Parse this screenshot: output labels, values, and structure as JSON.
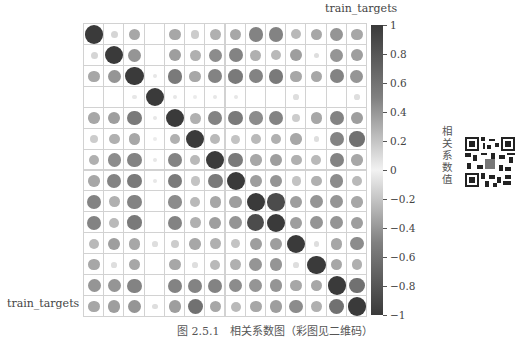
{
  "chart_data": {
    "type": "heatmap",
    "style": "correlation-circle-plot",
    "title": "",
    "xlabel": "train_targets",
    "ylabel": "train_targets",
    "n": 14,
    "colorbar": {
      "label": "相关系数值",
      "ticks": [
        "1",
        "0.8",
        "0.6",
        "0.4",
        "0.2",
        "0",
        "−0.2",
        "−0.4",
        "−0.6",
        "−0.8",
        "−1"
      ],
      "range": [
        -1,
        1
      ]
    },
    "matrix": [
      [
        1,
        0.15,
        0.4,
        0,
        0.4,
        0.2,
        0.35,
        0.4,
        0.6,
        0.6,
        0.3,
        0.4,
        0.5,
        0.4
      ],
      [
        0.15,
        1,
        0.5,
        0,
        0.45,
        0.35,
        0.55,
        0.6,
        0.35,
        0.3,
        0.45,
        0.1,
        0.5,
        0.45
      ],
      [
        0.4,
        0.5,
        1,
        0.05,
        0.65,
        0.4,
        0.6,
        0.65,
        0.6,
        0.65,
        0.4,
        0.4,
        0.6,
        0.5
      ],
      [
        0,
        0,
        0.05,
        1,
        0.05,
        0.03,
        0.05,
        0.05,
        0,
        0,
        0.1,
        0,
        0,
        0.1
      ],
      [
        0.4,
        0.45,
        0.65,
        0.05,
        1,
        0.35,
        0.6,
        0.65,
        0.55,
        0.6,
        0.2,
        0.4,
        0.6,
        0.45
      ],
      [
        0.2,
        0.35,
        0.4,
        0.03,
        0.35,
        1,
        0.3,
        0.25,
        0.3,
        0.35,
        0.4,
        0.1,
        0.6,
        0.7
      ],
      [
        0.35,
        0.55,
        0.6,
        0.05,
        0.6,
        0.3,
        1,
        0.65,
        0.4,
        0.45,
        0.35,
        0.3,
        0.6,
        0.4
      ],
      [
        0.4,
        0.6,
        0.65,
        0.05,
        0.65,
        0.25,
        0.65,
        1,
        0.45,
        0.5,
        0.25,
        0.35,
        0.55,
        0.3
      ],
      [
        0.6,
        0.35,
        0.6,
        0,
        0.55,
        0.3,
        0.4,
        0.45,
        1,
        0.9,
        0.45,
        0.5,
        0.5,
        0.4
      ],
      [
        0.6,
        0.3,
        0.65,
        0,
        0.6,
        0.35,
        0.45,
        0.5,
        0.9,
        1,
        0.45,
        0.5,
        0.5,
        0.45
      ],
      [
        0.3,
        0.45,
        0.4,
        0.1,
        0.2,
        0.4,
        0.35,
        0.25,
        0.45,
        0.45,
        1,
        0.1,
        0.4,
        0.55
      ],
      [
        0.4,
        0.1,
        0.4,
        0,
        0.4,
        0.1,
        0.3,
        0.35,
        0.5,
        0.5,
        0.1,
        1,
        0.4,
        0.35
      ],
      [
        0.5,
        0.5,
        0.6,
        0,
        0.6,
        0.6,
        0.6,
        0.55,
        0.5,
        0.5,
        0.4,
        0.4,
        1,
        0.7
      ],
      [
        0.4,
        0.45,
        0.5,
        0.1,
        0.45,
        0.7,
        0.4,
        0.3,
        0.4,
        0.45,
        0.55,
        0.35,
        0.7,
        1
      ]
    ],
    "grid": true,
    "legend_position": "right (colorbar)"
  },
  "labels": {
    "top": "train_targets",
    "left": "train_targets",
    "colorbar_title": "相关系数值",
    "caption": "图 2.5.1　相关系数图（彩图见二维码）"
  }
}
